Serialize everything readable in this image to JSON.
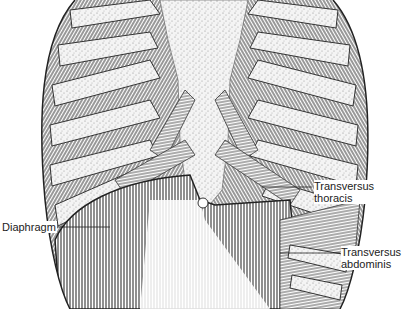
{
  "figure": {
    "labels": [
      {
        "id": "diaphragm",
        "text": "Diaphragm"
      },
      {
        "id": "transversus-thoracis",
        "line1": "Transversus",
        "line2": "thoracis"
      },
      {
        "id": "transversus-abdominis",
        "line1": "Transversus",
        "line2": "abdominis"
      }
    ],
    "colors": {
      "ink": "#222222",
      "cartilage": "#e6e6e6",
      "muscle": "#9a9a9a",
      "background": "#ffffff"
    }
  }
}
